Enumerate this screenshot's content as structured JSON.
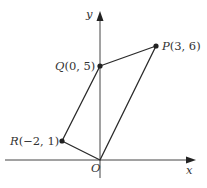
{
  "figure": {
    "axes": {
      "x_label": "x",
      "y_label": "y",
      "origin_label": "O"
    },
    "points": [
      {
        "id": "P",
        "label": "P(3, 6)",
        "name": "P",
        "coords": "(3, 6)"
      },
      {
        "id": "Q",
        "label": "Q(0, 5)",
        "name": "Q",
        "coords": "(0, 5)"
      },
      {
        "id": "R",
        "label": "R(−2, 1)",
        "name": "R",
        "coords": "(−2, 1)"
      },
      {
        "id": "O",
        "label": "O",
        "name": "O",
        "coords": "(0, 0)"
      }
    ],
    "polygon": [
      "O",
      "P",
      "Q",
      "R"
    ],
    "colors": {
      "line": "#2a2a2a",
      "axis": "#444444",
      "text": "#333333"
    }
  }
}
